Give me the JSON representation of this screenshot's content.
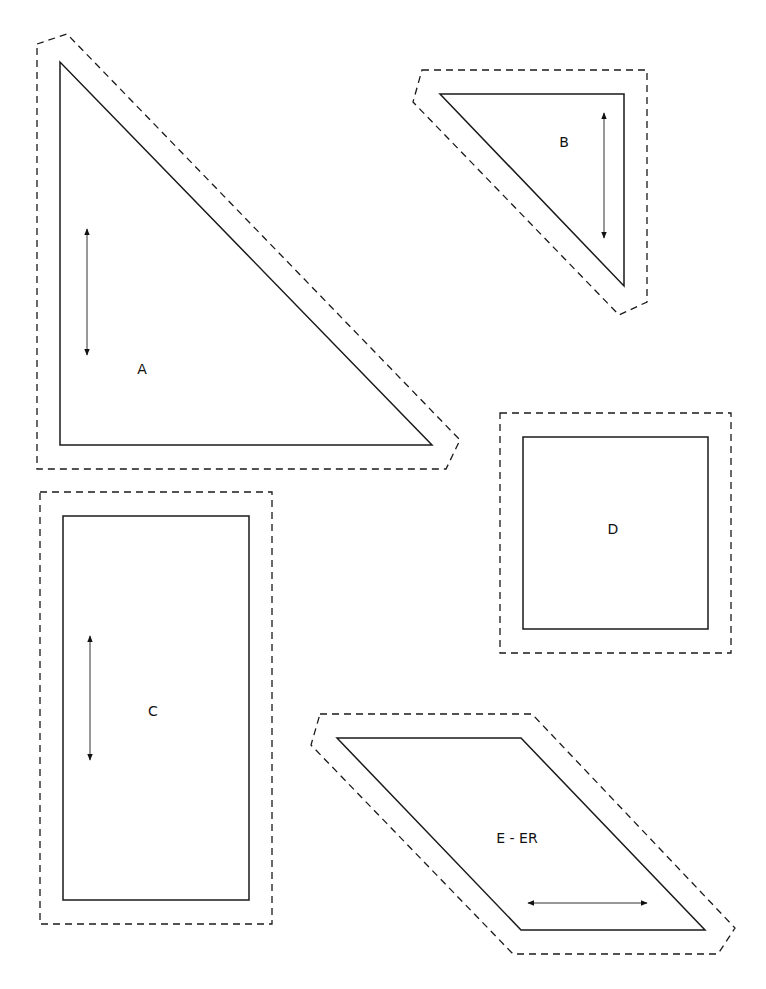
{
  "colors": {
    "background": "#ffffff",
    "line": "#1a1a1a"
  },
  "pieces": [
    {
      "id": "A",
      "label": "A",
      "shape": "right-triangle",
      "sew_line": "60,62 60,445 432,445",
      "cut_line": "37,44 67,34 460,440 446,469 37,469",
      "grainline": {
        "x1": 87,
        "y1": 229,
        "x2": 87,
        "y2": 355
      },
      "label_pos": {
        "x": 142,
        "y": 374
      }
    },
    {
      "id": "B",
      "label": "B",
      "shape": "right-triangle",
      "sew_line": "440,94 624,94 624,286",
      "cut_line": "422,70 647,70 647,302 619,315 413,102",
      "grainline": {
        "x1": 604,
        "y1": 113,
        "x2": 604,
        "y2": 238
      },
      "label_pos": {
        "x": 564,
        "y": 147
      }
    },
    {
      "id": "C",
      "label": "C",
      "shape": "rectangle",
      "sew_line": "63,516 249,516 249,900 63,900",
      "cut_line": "40,492 272,492 272,924 40,924",
      "grainline": {
        "x1": 90,
        "y1": 636,
        "x2": 90,
        "y2": 760
      },
      "label_pos": {
        "x": 153,
        "y": 716
      }
    },
    {
      "id": "D",
      "label": "D",
      "shape": "square",
      "sew_line": "523,437 708,437 708,629 523,629",
      "cut_line": "500,413 731,413 731,653 500,653",
      "grainline": null,
      "label_pos": {
        "x": 613,
        "y": 534
      }
    },
    {
      "id": "E",
      "label": "E - ER",
      "shape": "parallelogram",
      "sew_line": "337,738 521,738 705,930 521,930",
      "cut_line": "320,714 532,714 735,928 718,954 513,954 311,745",
      "grainline": {
        "x1": 528,
        "y1": 903,
        "x2": 647,
        "y2": 903
      },
      "label_pos": {
        "x": 517,
        "y": 843
      }
    }
  ]
}
